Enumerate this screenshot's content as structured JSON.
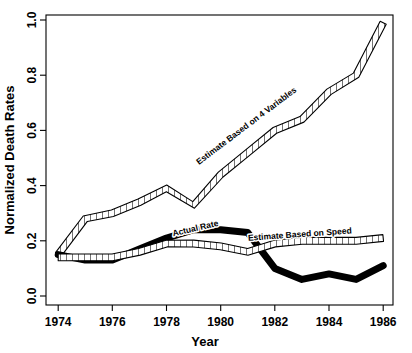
{
  "chart_data": {
    "type": "line",
    "title": "",
    "xlabel": "Year",
    "ylabel": "Normalized Death Rates",
    "xlim": [
      1973.5,
      1986.5
    ],
    "ylim": [
      0.0,
      1.02
    ],
    "grid": false,
    "legend_position": "inline-annotations",
    "xticks": [
      "1974",
      "1976",
      "1978",
      "1980",
      "1982",
      "1984",
      "1986"
    ],
    "xtick_values": [
      1974,
      1976,
      1978,
      1980,
      1982,
      1984,
      1986
    ],
    "yticks": [
      "0.0",
      "0.2",
      "0.4",
      "0.6",
      "0.8",
      "1.0"
    ],
    "ytick_values": [
      0.0,
      0.2,
      0.4,
      0.6,
      0.8,
      1.0
    ],
    "x": [
      1974,
      1975,
      1976,
      1977,
      1978,
      1979,
      1980,
      1981,
      1982,
      1983,
      1984,
      1985,
      1986
    ],
    "series": [
      {
        "name": "Estimate Based on 4 Variables",
        "style": "hatched-band",
        "label_text": "Estimate Based on 4 Variables",
        "values": [
          0.15,
          0.28,
          0.3,
          0.34,
          0.39,
          0.33,
          0.44,
          0.52,
          0.6,
          0.64,
          0.74,
          0.8,
          0.99
        ]
      },
      {
        "name": "Actual Rate",
        "style": "thick-solid",
        "label_text": "Actual Rate",
        "values": [
          0.15,
          0.13,
          0.13,
          0.17,
          0.21,
          0.24,
          0.24,
          0.23,
          0.1,
          0.06,
          0.08,
          0.06,
          0.11
        ]
      },
      {
        "name": "Estimate Based on Speed",
        "style": "hatched-band",
        "label_text": "Estimate Based on Speed",
        "values": [
          0.14,
          0.14,
          0.14,
          0.16,
          0.19,
          0.19,
          0.18,
          0.16,
          0.19,
          0.2,
          0.2,
          0.2,
          0.21
        ]
      }
    ]
  }
}
